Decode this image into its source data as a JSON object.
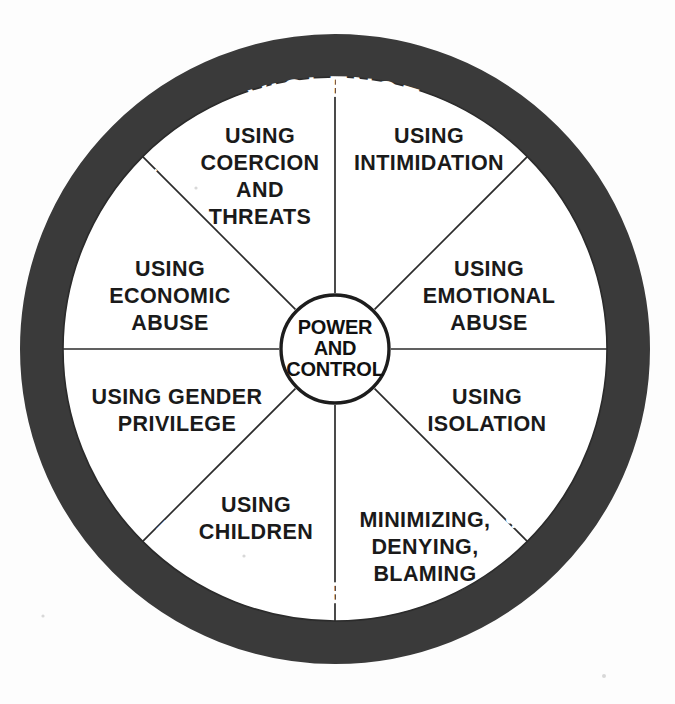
{
  "diagram": {
    "hub": {
      "line1": "POWER",
      "line2": "AND",
      "line3": "CONTROL"
    },
    "outer_ring": {
      "top": {
        "left_word": "SEXUAL",
        "center_word": "VIOLENCE",
        "right_word": "PHYSICAL"
      },
      "bottom": {
        "left_word": "PHYSICAL",
        "center_word": "VIOLENCE",
        "right_word": "SEXUAL"
      }
    },
    "segments": [
      {
        "id": "using-coercion-and-threats",
        "lines": [
          "USING",
          "COERCION",
          "AND",
          "THREATS"
        ]
      },
      {
        "id": "using-intimidation",
        "lines": [
          "USING",
          "INTIMIDATION"
        ]
      },
      {
        "id": "using-emotional-abuse",
        "lines": [
          "USING",
          "EMOTIONAL",
          "ABUSE"
        ]
      },
      {
        "id": "using-isolation",
        "lines": [
          "USING",
          "ISOLATION"
        ]
      },
      {
        "id": "minimizing-denying-blaming",
        "lines": [
          "MINIMIZING,",
          "DENYING,",
          "BLAMING"
        ]
      },
      {
        "id": "using-children",
        "lines": [
          "USING",
          "CHILDREN"
        ]
      },
      {
        "id": "using-gender-privilege",
        "lines": [
          "USING GENDER",
          "PRIVILEGE"
        ]
      },
      {
        "id": "using-economic-abuse",
        "lines": [
          "USING",
          "ECONOMIC",
          "ABUSE"
        ]
      }
    ],
    "colors": {
      "ring_fill": "#3a3a3a",
      "ring_text": "#ffffff",
      "face_fill": "#ffffff",
      "line_stroke": "#2b2b2b",
      "segment_text": "#1a1a1a",
      "background": "#fdfdfd"
    }
  }
}
